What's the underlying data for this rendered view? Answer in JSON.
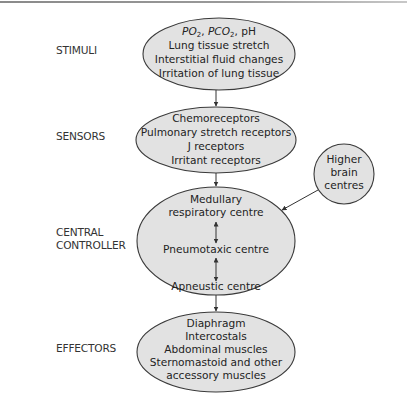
{
  "diagram": {
    "title": "",
    "stages": [
      {
        "id": "stimuli",
        "label_lines": [
          "STIMULI"
        ]
      },
      {
        "id": "sensors",
        "label_lines": [
          "SENSORS"
        ]
      },
      {
        "id": "controller",
        "label_lines": [
          "CENTRAL",
          "CONTROLLER"
        ]
      },
      {
        "id": "effectors",
        "label_lines": [
          "EFFECTORS"
        ]
      }
    ],
    "nodes": {
      "stimuli": {
        "header": {
          "po2": "PO",
          "po2_sub": "2",
          "sep1": ", ",
          "pco2": "PCO",
          "pco2_sub": "2",
          "sep2": ", pH"
        },
        "lines": [
          "Lung tissue stretch",
          "Interstitial fluid changes",
          "Irritation of lung tissue"
        ]
      },
      "sensors": {
        "lines": [
          "Chemoreceptors",
          "Pulmonary stretch receptors",
          "J receptors",
          "Irritant receptors"
        ]
      },
      "controller": {
        "lines": [
          "Medullary",
          "respiratory centre",
          "Pneumotaxic centre",
          "Apneustic centre"
        ]
      },
      "effectors": {
        "lines": [
          "Diaphragm",
          "Intercostals",
          "Abdominal muscles",
          "Sternomastoid and other",
          "accessory muscles"
        ]
      },
      "higher_brain": {
        "lines": [
          "Higher",
          "brain",
          "centres"
        ]
      }
    },
    "edges": [
      {
        "from": "stimuli",
        "to": "sensors",
        "type": "arrow"
      },
      {
        "from": "sensors",
        "to": "controller",
        "type": "arrow"
      },
      {
        "from": "controller",
        "to": "effectors",
        "type": "arrow"
      },
      {
        "from": "higher_brain",
        "to": "controller",
        "type": "arrow"
      },
      {
        "from": "medullary_respiratory_centre",
        "to": "pneumotaxic_centre",
        "type": "bidirectional"
      },
      {
        "from": "pneumotaxic_centre",
        "to": "apneustic_centre",
        "type": "bidirectional"
      }
    ],
    "colors": {
      "node_fill": "#e2e2e2",
      "node_stroke": "#3a3a3a",
      "text": "#222222",
      "background": "#ffffff"
    }
  }
}
